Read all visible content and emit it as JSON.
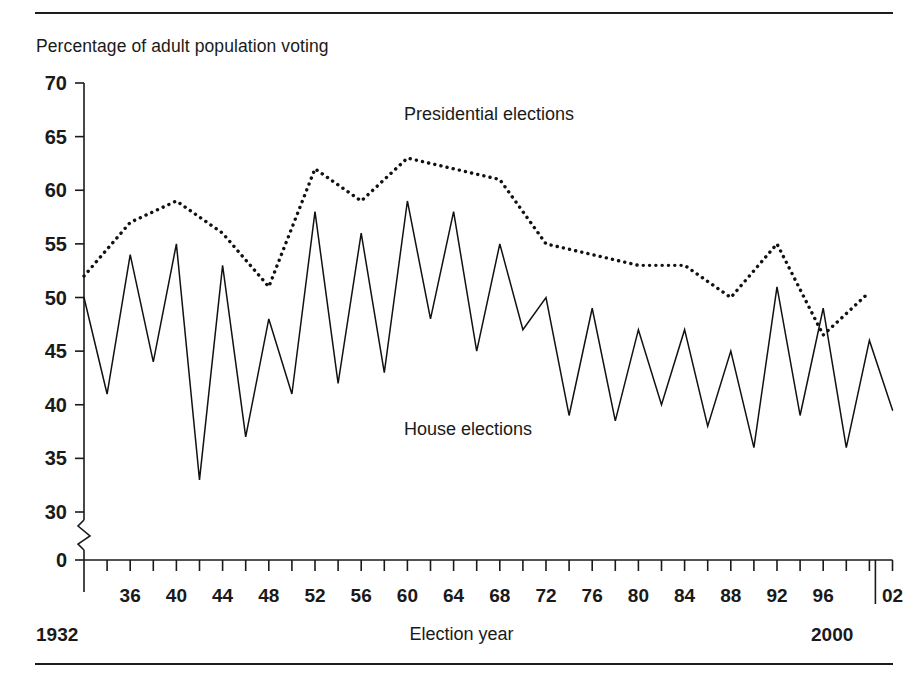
{
  "figure": {
    "y_axis_title": "Percentage of adult population voting",
    "x_axis_title": "Election year",
    "start_year_label": "1932",
    "end_year_label": "2000"
  },
  "chart_data": {
    "type": "line",
    "title": "",
    "subtitle": "",
    "ylabel": "Percentage of adult population voting",
    "xlabel": "Election year",
    "ylim": [
      0,
      70
    ],
    "y_ticks": [
      0,
      30,
      35,
      40,
      45,
      50,
      55,
      60,
      65,
      70
    ],
    "y_axis_break": true,
    "y_axis_break_between": [
      0,
      30
    ],
    "grid": false,
    "legend_position": "inline-annotations",
    "x_tick_labels": [
      "36",
      "40",
      "44",
      "48",
      "52",
      "56",
      "60",
      "64",
      "68",
      "72",
      "76",
      "80",
      "84",
      "88",
      "92",
      "96",
      "02"
    ],
    "x_minor_tick_interval_years": 2,
    "x_major_label_interval_years": 4,
    "x_range": [
      1932,
      2002
    ],
    "series": [
      {
        "name": "Presidential elections",
        "style": "dotted",
        "color": "#111111",
        "x": [
          1932,
          1936,
          1940,
          1944,
          1948,
          1952,
          1956,
          1960,
          1964,
          1968,
          1972,
          1976,
          1980,
          1984,
          1988,
          1992,
          1996,
          2000
        ],
        "values": [
          52,
          57,
          59,
          56,
          51,
          62,
          59,
          63,
          62,
          61,
          55,
          54,
          53,
          53,
          50,
          55,
          46.5,
          50.5
        ]
      },
      {
        "name": "House elections",
        "style": "solid",
        "color": "#111111",
        "x": [
          1932,
          1934,
          1936,
          1938,
          1940,
          1942,
          1944,
          1946,
          1948,
          1950,
          1952,
          1954,
          1956,
          1958,
          1960,
          1962,
          1964,
          1966,
          1968,
          1970,
          1972,
          1974,
          1976,
          1978,
          1980,
          1982,
          1984,
          1986,
          1988,
          1990,
          1992,
          1994,
          1996,
          1998,
          2000,
          2002
        ],
        "values": [
          50,
          41,
          54,
          44,
          55,
          33,
          53,
          37,
          48,
          41,
          58,
          42,
          56,
          43,
          59,
          48,
          58,
          45,
          55,
          47,
          50,
          39,
          49,
          38.5,
          47,
          40,
          47,
          38,
          45,
          36,
          51,
          39,
          49,
          36,
          46,
          39.5
        ]
      }
    ],
    "annotations": [
      {
        "text": "Presidential elections",
        "at_x": 1957,
        "at_y": 67
      },
      {
        "text": "House elections",
        "at_y": 36,
        "at_x": 1957
      }
    ]
  }
}
